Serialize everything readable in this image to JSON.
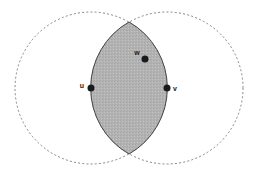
{
  "diagram": {
    "circles": [
      {
        "name": "circle-u",
        "cx": 91,
        "cy": 88,
        "r": 76,
        "style": "dashed"
      },
      {
        "name": "circle-v",
        "cx": 167,
        "cy": 88,
        "r": 76,
        "style": "dashed"
      }
    ],
    "lens": {
      "fill": "#b3b3b3",
      "stroke": "#444444",
      "top": [
        129,
        22
      ],
      "bottom": [
        129,
        154
      ]
    },
    "points": [
      {
        "id": "u",
        "label": "u",
        "x": 91,
        "y": 88,
        "label_x": 82,
        "label_y": 88
      },
      {
        "id": "v",
        "label": "v",
        "x": 167,
        "y": 88,
        "label_x": 175,
        "label_y": 91
      },
      {
        "id": "w",
        "label": "w",
        "x": 145,
        "y": 59,
        "label_x": 137,
        "label_y": 55
      }
    ],
    "colors": {
      "point": "#1a1a1a",
      "dashed": "#777777"
    }
  }
}
